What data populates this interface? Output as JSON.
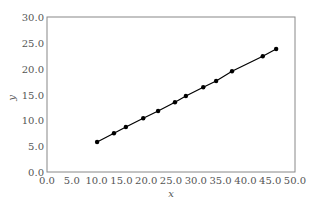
{
  "chart_data": {
    "type": "line",
    "title": "",
    "xlabel": "x",
    "ylabel": "y",
    "xlim": [
      0,
      50
    ],
    "ylim": [
      0,
      30
    ],
    "grid": false,
    "legend": null,
    "x_ticks": [
      "0.0",
      "5.0",
      "10.0",
      "15.0",
      "20.0",
      "25.0",
      "30.0",
      "35.0",
      "40.0",
      "45.0",
      "50.0"
    ],
    "y_ticks": [
      "0.0",
      "5.0",
      "10.0",
      "15.0",
      "20.0",
      "25.0",
      "30.0"
    ],
    "series": [
      {
        "name": "y",
        "marker": "circle",
        "color": "#000000",
        "x": [
          10.1,
          13.5,
          15.9,
          19.4,
          22.4,
          25.8,
          28.0,
          31.5,
          34.1,
          37.3,
          43.5,
          46.2
        ],
        "y": [
          5.8,
          7.5,
          8.7,
          10.4,
          11.8,
          13.5,
          14.7,
          16.4,
          17.6,
          19.5,
          22.4,
          23.8
        ]
      }
    ]
  },
  "style": {
    "axis_color": "#888888",
    "text_color": "#555555",
    "line_color": "#000000"
  }
}
